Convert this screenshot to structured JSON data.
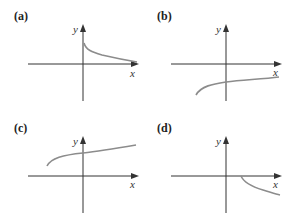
{
  "figure": {
    "panels": [
      {
        "label": "(a)",
        "x_axis_label": "x",
        "y_axis_label": "y",
        "curve": "decreasing, starts on positive y-axis, approaches x-axis"
      },
      {
        "label": "(b)",
        "x_axis_label": "x",
        "y_axis_label": "y",
        "curve": "increasing, starts at left below x-axis, stays below x-axis"
      },
      {
        "label": "(c)",
        "x_axis_label": "x",
        "y_axis_label": "y",
        "curve": "increasing, starts at left above x-axis"
      },
      {
        "label": "(d)",
        "x_axis_label": "x",
        "y_axis_label": "y",
        "curve": "decreasing, starts on positive x-axis, goes below"
      }
    ],
    "colors": {
      "axis": "#333333",
      "curve": "#8c8c8c"
    }
  }
}
